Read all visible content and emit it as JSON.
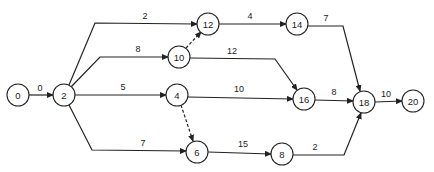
{
  "diagram": {
    "type": "activity-on-arrow network",
    "nodes": [
      {
        "id": "0",
        "label": "0",
        "x": 18,
        "y": 95
      },
      {
        "id": "2",
        "label": "2",
        "x": 64,
        "y": 95
      },
      {
        "id": "12",
        "label": "12",
        "x": 208,
        "y": 24
      },
      {
        "id": "14",
        "label": "14",
        "x": 297,
        "y": 24
      },
      {
        "id": "10",
        "label": "10",
        "x": 179,
        "y": 57
      },
      {
        "id": "4",
        "label": "4",
        "x": 177,
        "y": 95
      },
      {
        "id": "16",
        "label": "16",
        "x": 304,
        "y": 99
      },
      {
        "id": "18",
        "label": "18",
        "x": 364,
        "y": 102
      },
      {
        "id": "20",
        "label": "20",
        "x": 413,
        "y": 101
      },
      {
        "id": "6",
        "label": "6",
        "x": 197,
        "y": 152
      },
      {
        "id": "8",
        "label": "8",
        "x": 282,
        "y": 154
      }
    ],
    "edges": [
      {
        "from": "0",
        "to": "2",
        "label": "0",
        "dashed": false,
        "path": "M29,95 L53,95",
        "lx": 40,
        "ly": 91
      },
      {
        "from": "2",
        "to": "12",
        "label": "2",
        "dashed": false,
        "path": "M69,85 L95,23 L197,24",
        "lx": 145,
        "ly": 19
      },
      {
        "from": "2",
        "to": "10",
        "label": "8",
        "dashed": false,
        "path": "M71,87 L100,57 L168,57",
        "lx": 138,
        "ly": 52
      },
      {
        "from": "2",
        "to": "4",
        "label": "5",
        "dashed": false,
        "path": "M75,95 L166,95",
        "lx": 123,
        "ly": 90
      },
      {
        "from": "2",
        "to": "6",
        "label": "7",
        "dashed": false,
        "path": "M69,105 L92,150 L186,151",
        "lx": 143,
        "ly": 146
      },
      {
        "from": "10",
        "to": "12",
        "label": "",
        "dashed": true,
        "path": "M186,48 L201,32",
        "lx": 0,
        "ly": 0
      },
      {
        "from": "12",
        "to": "14",
        "label": "4",
        "dashed": false,
        "path": "M219,24 L286,24",
        "lx": 250,
        "ly": 19
      },
      {
        "from": "14",
        "to": "18",
        "label": "7",
        "dashed": false,
        "path": "M308,26 L343,26 L360,91",
        "lx": 326,
        "ly": 21
      },
      {
        "from": "10",
        "to": "16",
        "label": "12",
        "dashed": false,
        "path": "M190,58 L275,59 L297,90",
        "lx": 232,
        "ly": 54
      },
      {
        "from": "4",
        "to": "6",
        "label": "",
        "dashed": true,
        "path": "M181,105 L193,141",
        "lx": 0,
        "ly": 0
      },
      {
        "from": "4",
        "to": "16",
        "label": "10",
        "dashed": false,
        "path": "M188,97 L293,99",
        "lx": 239,
        "ly": 92
      },
      {
        "from": "16",
        "to": "18",
        "label": "8",
        "dashed": false,
        "path": "M315,100 L353,101",
        "lx": 334,
        "ly": 95
      },
      {
        "from": "18",
        "to": "20",
        "label": "10",
        "dashed": false,
        "path": "M375,102 L402,101",
        "lx": 386,
        "ly": 97
      },
      {
        "from": "6",
        "to": "8",
        "label": "15",
        "dashed": false,
        "path": "M208,152 L271,154",
        "lx": 243,
        "ly": 147
      },
      {
        "from": "8",
        "to": "18",
        "label": "2",
        "dashed": false,
        "path": "M293,155 L344,155 L361,113",
        "lx": 315,
        "ly": 150
      }
    ]
  },
  "colors": {
    "stroke": "#222222",
    "background": "#ffffff"
  }
}
